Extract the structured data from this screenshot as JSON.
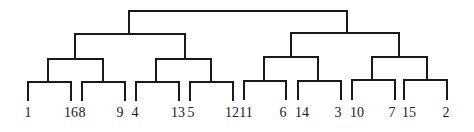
{
  "diagram": {
    "type": "dendrogram",
    "leaf_order": [
      "1",
      "16",
      "8",
      "9",
      "4",
      "13",
      "5",
      "12",
      "11",
      "6",
      "14",
      "3",
      "10",
      "7",
      "15",
      "2"
    ],
    "tree": {
      "children": [
        {
          "children": [
            {
              "children": [
                {
                  "children": [
                    "1",
                    "16"
                  ]
                },
                {
                  "children": [
                    "8",
                    "9"
                  ]
                }
              ]
            },
            {
              "children": [
                {
                  "children": [
                    "4",
                    "13"
                  ]
                },
                {
                  "children": [
                    "5",
                    "12"
                  ]
                }
              ]
            }
          ]
        },
        {
          "children": [
            {
              "children": [
                {
                  "children": [
                    "11",
                    "6"
                  ]
                },
                {
                  "children": [
                    "14",
                    "3"
                  ]
                }
              ]
            },
            {
              "children": [
                {
                  "children": [
                    "10",
                    "7"
                  ]
                },
                {
                  "children": [
                    "15",
                    "2"
                  ]
                }
              ]
            }
          ]
        }
      ]
    },
    "line_color": "#1a1a1a",
    "background": "#ffffff"
  }
}
